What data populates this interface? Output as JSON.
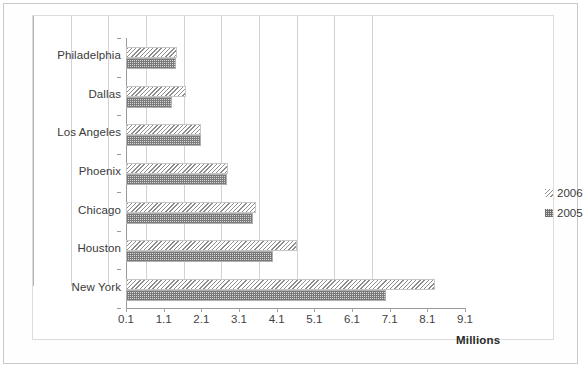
{
  "chart_data": {
    "type": "bar",
    "orientation": "horizontal",
    "title": "",
    "subtitle": "",
    "xlabel": "Millions",
    "ylabel": "",
    "xlim": [
      0.1,
      9.1
    ],
    "xticks": [
      "0.1",
      "1.1",
      "2.1",
      "3.1",
      "4.1",
      "5.1",
      "6.1",
      "7.1",
      "8.1",
      "9.1"
    ],
    "xtick_values": [
      0.1,
      1.1,
      2.1,
      3.1,
      4.1,
      5.1,
      6.1,
      7.1,
      8.1,
      9.1
    ],
    "grid": "vertical",
    "legend_position": "right",
    "categories": [
      "Philadelphia",
      "Dallas",
      "Los Angeles",
      "Phoenix",
      "Chicago",
      "Houston",
      "New York"
    ],
    "series": [
      {
        "name": "2006",
        "pattern": "diagonal-hatch",
        "color": "#8d8d8d",
        "values": [
          1.45,
          1.7,
          2.1,
          2.82,
          3.55,
          4.65,
          8.3
        ]
      },
      {
        "name": "2005",
        "pattern": "checker-dots",
        "color": "#7a7a7a",
        "values": [
          1.43,
          1.33,
          2.1,
          2.77,
          3.48,
          4.0,
          7.0
        ]
      }
    ]
  },
  "legend": {
    "items": [
      {
        "label": "2006",
        "swatch": "swatch-2006"
      },
      {
        "label": "2005",
        "swatch": "swatch-2005"
      }
    ]
  },
  "colors": {
    "gridline": "#d2d2d2",
    "axis": "#9a9a9a",
    "text": "#3a3a3a",
    "frame": "#dcdcdc",
    "page_border": "#c9c9c9",
    "background": "#ffffff"
  }
}
